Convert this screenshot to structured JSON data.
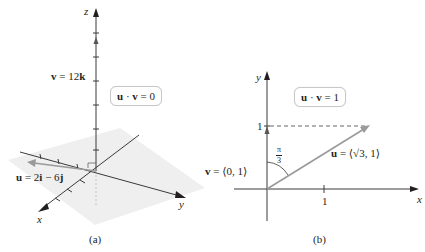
{
  "panel_a": {
    "caption": "(a)",
    "axes": {
      "x": "x",
      "y": "y",
      "z": "z"
    },
    "dot_product_label": "u · v = 0",
    "dot_lhs_u": "u",
    "dot_op": "·",
    "dot_lhs_v": "v",
    "dot_rhs": "= 0",
    "v_label": {
      "name": "v",
      "eq": " = 12",
      "comp": "k"
    },
    "u_label": {
      "name": "u",
      "eq": " = 2",
      "c1": "i",
      "mid": " − 6",
      "c2": "j"
    },
    "colors": {
      "axis": "#3a3a3a",
      "vector": "#9a9a9a",
      "plane": "#ececec"
    }
  },
  "panel_b": {
    "caption": "(b)",
    "axes": {
      "x": "x",
      "y": "y"
    },
    "dot_lhs_u": "u",
    "dot_op": "·",
    "dot_lhs_v": "v",
    "dot_rhs": "= 1",
    "y_tick_label": "1",
    "x_tick_label": "1",
    "angle_label": {
      "num": "π",
      "den": "3"
    },
    "v_label": {
      "name": "v",
      "eq": " = ⟨0, 1⟩"
    },
    "u_label": {
      "name": "u",
      "eq": " = ⟨√3, 1⟩"
    },
    "colors": {
      "axis": "#3a3a3a",
      "vector": "#9a9a9a"
    }
  }
}
